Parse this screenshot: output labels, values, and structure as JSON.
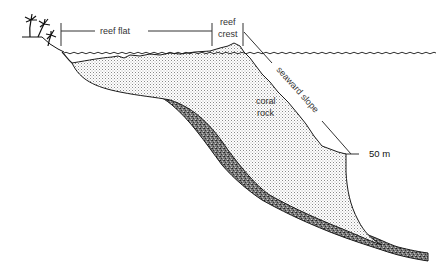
{
  "diagram": {
    "type": "cross-section",
    "labels": {
      "reef_flat": "reef flat",
      "reef_crest_line1": "reef",
      "reef_crest_line2": "crest",
      "seaward_slope": "seaward slope",
      "coral_rock_line1": "coral",
      "coral_rock_line2": "rock",
      "depth": "50 m"
    },
    "features": [
      "palm-trees",
      "sea-surface",
      "coral-rock-body",
      "sediment-base-layer"
    ],
    "colors": {
      "outline": "#1a1a1a",
      "stipple": "#9a9a9a",
      "sediment": "#5a5a5a",
      "label": "#333333"
    }
  }
}
